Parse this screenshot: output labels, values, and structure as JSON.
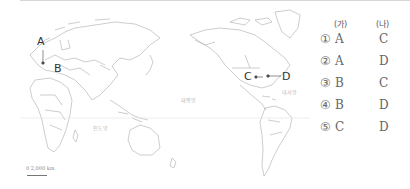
{
  "map": {
    "type": "world map (Pacific-centered)",
    "markers": [
      {
        "id": "A",
        "label": "A"
      },
      {
        "id": "B",
        "label": "B"
      },
      {
        "id": "C",
        "label": "C"
      },
      {
        "id": "D",
        "label": "D"
      }
    ],
    "oceans": {
      "pacific": "태평양",
      "atlantic": "대서양",
      "indian": "인도양"
    },
    "scale": {
      "label": "0   2,000 km"
    }
  },
  "choices": {
    "headers": [
      "(가)",
      "(나)"
    ],
    "rows": [
      {
        "num": "①",
        "ga": "A",
        "na": "C"
      },
      {
        "num": "②",
        "ga": "A",
        "na": "D"
      },
      {
        "num": "③",
        "ga": "B",
        "na": "C"
      },
      {
        "num": "④",
        "ga": "B",
        "na": "D"
      },
      {
        "num": "⑤",
        "ga": "C",
        "na": "D"
      }
    ]
  }
}
